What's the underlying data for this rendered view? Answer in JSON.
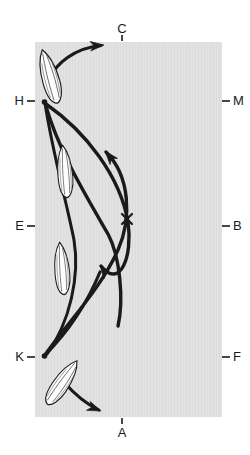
{
  "figure": {
    "title": "",
    "field_color": "#e2e2e2",
    "stroke_color": "#1a1a1a",
    "shape_fill": "#fdfdfd",
    "label_color": "#1a1a1a"
  },
  "field": {
    "x": 35,
    "y": 42,
    "width": 187,
    "height": 375
  },
  "labels": {
    "top": {
      "text": "C",
      "x": 122,
      "y": 29
    },
    "bottom": {
      "text": "A",
      "x": 122,
      "y": 434
    },
    "left_upper": {
      "text": "H",
      "x": 20,
      "y": 101
    },
    "left_middle": {
      "text": "E",
      "x": 20,
      "y": 226
    },
    "left_lower": {
      "text": "K",
      "x": 20,
      "y": 357
    },
    "right_upper": {
      "text": "M",
      "x": 236,
      "y": 101
    },
    "right_middle": {
      "text": "B",
      "x": 236,
      "y": 226
    },
    "right_lower": {
      "text": "F",
      "x": 236,
      "y": 357
    }
  },
  "ticks": [
    {
      "name": "tick-C",
      "orientation": "vertical",
      "x1": 122,
      "y1": 35,
      "x2": 122,
      "y2": 41
    },
    {
      "name": "tick-A",
      "orientation": "vertical",
      "x1": 122,
      "y1": 418,
      "x2": 122,
      "y2": 424
    },
    {
      "name": "tick-H",
      "orientation": "horizontal",
      "x1": 27,
      "y1": 101,
      "x2": 35,
      "y2": 101
    },
    {
      "name": "tick-E",
      "orientation": "horizontal",
      "x1": 27,
      "y1": 226,
      "x2": 35,
      "y2": 226
    },
    {
      "name": "tick-K",
      "orientation": "horizontal",
      "x1": 27,
      "y1": 357,
      "x2": 35,
      "y2": 357
    },
    {
      "name": "tick-M",
      "orientation": "horizontal",
      "x1": 222,
      "y1": 101,
      "x2": 230,
      "y2": 101
    },
    {
      "name": "tick-B",
      "orientation": "horizontal",
      "x1": 222,
      "y1": 226,
      "x2": 230,
      "y2": 226
    },
    {
      "name": "tick-F",
      "orientation": "horizontal",
      "x1": 222,
      "y1": 357,
      "x2": 230,
      "y2": 357
    }
  ],
  "nodes": {
    "H": {
      "x": 44,
      "y": 101
    },
    "K": {
      "x": 44,
      "y": 357
    }
  },
  "marker_x": {
    "name": "x-marker",
    "x": 127,
    "y": 219,
    "size": 7
  },
  "paths": {
    "upstroke_outer": "M44,101 C44,140 58,190 78,232 C98,274 118,306 127,330",
    "upstroke_inner": "M44,101 C46,148 62,196 82,240 C96,272 106,302 110,322",
    "downstroke_outer": "M44,357 C70,322 100,284 120,246 C133,220 136,176 124,146",
    "downstroke_inner": "M44,357 C66,330 92,298 110,266 C124,240 128,200 118,172",
    "leading_in_top": "M58,70 C72,52 92,44 108,46",
    "leading_out_bottom": "M68,385 C82,398 96,406 104,411"
  },
  "arrowheads": [
    {
      "name": "arrowhead-top",
      "x": 104,
      "y": 45,
      "angle": 12
    },
    {
      "name": "arrowhead-mid-upper",
      "x": 104,
      "y": 152,
      "angle": -62
    },
    {
      "name": "arrowhead-mid-lower",
      "x": 99,
      "y": 264,
      "angle": -55
    },
    {
      "name": "arrowhead-bottom",
      "x": 102,
      "y": 411,
      "angle": 33
    }
  ],
  "plume_shapes": [
    {
      "name": "plume-upper-H",
      "cx": 50,
      "cy": 78,
      "angle": -18
    },
    {
      "name": "plume-mid-upper",
      "cx": 65,
      "cy": 172,
      "angle": -6
    },
    {
      "name": "plume-mid-lower",
      "cx": 63,
      "cy": 268,
      "angle": -6
    },
    {
      "name": "plume-lower-K",
      "cx": 62,
      "cy": 383,
      "angle": 32
    }
  ]
}
